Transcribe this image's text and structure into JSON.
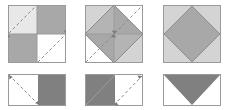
{
  "canvas": {
    "width": 240,
    "height": 110,
    "background": "#ffffff",
    "title": "geometric-dissection-figure-set"
  },
  "palette": {
    "white": "#ffffff",
    "very_light_gray": "#e8e8e8",
    "light_gray": "#d4d4d4",
    "medium_gray": "#a8a8a8",
    "dark_gray": "#808080",
    "outline": "#9a9a9a",
    "dash_line": "#8a8a8a",
    "arrow_head": "#7a7a7a"
  },
  "layout": {
    "rows": 2,
    "columns": 3,
    "row_labels": [
      "top-row",
      "bottom-row"
    ]
  },
  "figures": [
    {
      "id": "figure-1",
      "name": "checkerboard-square-with-diagonal-arrows",
      "position": "top-left",
      "x": 8,
      "y": 5,
      "width": 58,
      "height": 58,
      "shape": "square",
      "description": "Square divided into four equal quadrants in a checkerboard pattern with two dashed diagonal double arrows running lower-left to upper-right.",
      "quadrants": [
        {
          "name": "top-left",
          "fill": "#e8e8e8"
        },
        {
          "name": "top-right",
          "fill": "#a8a8a8"
        },
        {
          "name": "bottom-left",
          "fill": "#a8a8a8"
        },
        {
          "name": "bottom-right",
          "fill": "#ffffff"
        }
      ],
      "annotations": [
        {
          "name": "dashed-arrow-upper",
          "style": "dashed",
          "direction": "double-headed",
          "orientation": "diagonal-up-right"
        },
        {
          "name": "dashed-arrow-lower",
          "style": "dashed",
          "direction": "double-headed",
          "orientation": "diagonal-up-right"
        }
      ]
    },
    {
      "id": "figure-2",
      "name": "inscribed-diamond-square-with-diagonal-arrows",
      "position": "top-center",
      "x": 85,
      "y": 5,
      "width": 58,
      "height": 58,
      "shape": "square",
      "description": "Square with inscribed diamond whose vertices touch the midpoints of the sides; quadrant shading with corner triangles, plus dashed double arrows along the diamond edges.",
      "quadrants": [
        {
          "name": "top-left",
          "fill": "#d4d4d4"
        },
        {
          "name": "top-right",
          "fill": "#ffffff"
        },
        {
          "name": "bottom-left",
          "fill": "#ffffff"
        },
        {
          "name": "bottom-right",
          "fill": "#d4d4d4"
        }
      ],
      "diamond": {
        "name": "inscribed-diamond",
        "fill": "#a8a8a8",
        "vertices": "side-midpoints"
      },
      "annotations": [
        {
          "name": "dashed-arrow-upper-right",
          "style": "dashed",
          "direction": "double-headed",
          "orientation": "diagonal-up-right"
        },
        {
          "name": "dashed-arrow-lower-left",
          "style": "dashed",
          "direction": "double-headed",
          "orientation": "diagonal-up-right"
        }
      ]
    },
    {
      "id": "figure-3",
      "name": "light-square-with-gray-diamond",
      "position": "top-right",
      "x": 163,
      "y": 5,
      "width": 58,
      "height": 58,
      "shape": "square",
      "description": "Light gray square containing a single solid medium gray diamond inscribed on the side midpoints, with no dissection lines.",
      "square": {
        "name": "outer-square",
        "fill": "#d4d4d4"
      },
      "diamond": {
        "name": "inscribed-diamond",
        "fill": "#a8a8a8",
        "vertices": "side-midpoints"
      },
      "annotations": []
    },
    {
      "id": "figure-4",
      "name": "half-shaded-rectangle-with-dashed-diagonal",
      "position": "bottom-left",
      "x": 8,
      "y": 74,
      "width": 58,
      "height": 32,
      "shape": "rectangle",
      "description": "Rectangle with the right half filled dark gray and the left half white, crossed by a dashed diagonal arrow from top-left to bottom-right.",
      "regions": [
        {
          "name": "left-half",
          "fill": "#ffffff"
        },
        {
          "name": "right-half",
          "fill": "#808080"
        }
      ],
      "annotations": [
        {
          "name": "dashed-arrow-diagonal",
          "style": "dashed",
          "direction": "double-headed",
          "orientation": "diagonal-down-right"
        }
      ]
    },
    {
      "id": "figure-5",
      "name": "left-triangle-rectangle-with-dashed-diagonal",
      "position": "bottom-center",
      "x": 85,
      "y": 74,
      "width": 58,
      "height": 32,
      "shape": "rectangle",
      "description": "Rectangle containing a dark gray right triangle anchored to the top-left corner, with a dashed diagonal arrow across the open right portion.",
      "regions": [
        {
          "name": "dark-triangle",
          "fill": "#808080",
          "anchor": "top-left"
        },
        {
          "name": "white-region",
          "fill": "#ffffff"
        }
      ],
      "annotations": [
        {
          "name": "dashed-arrow-diagonal",
          "style": "dashed",
          "direction": "double-headed",
          "orientation": "diagonal-up-right"
        }
      ]
    },
    {
      "id": "figure-6",
      "name": "downward-triangle-rectangle",
      "position": "bottom-right",
      "x": 163,
      "y": 74,
      "width": 58,
      "height": 32,
      "shape": "rectangle",
      "description": "Rectangle containing a solid dark gray downward-pointing triangle spanning the full top edge and meeting at the bottom midpoint.",
      "regions": [
        {
          "name": "down-triangle",
          "fill": "#808080",
          "anchor": "top-edge"
        },
        {
          "name": "white-region",
          "fill": "#ffffff"
        }
      ],
      "annotations": []
    }
  ]
}
